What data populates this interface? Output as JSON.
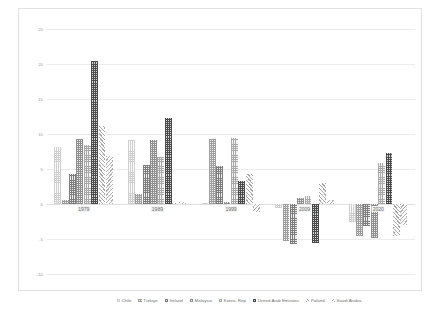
{
  "chart_data": {
    "type": "bar",
    "title": "",
    "subtitle": "",
    "xlabel": "",
    "ylabel": "",
    "categories": [
      "1979",
      "1989",
      "1999",
      "2009",
      "2020"
    ],
    "ylim": [
      -10,
      25
    ],
    "yticks": [
      25,
      20,
      15,
      10,
      5,
      0,
      -5,
      -10
    ],
    "ytick_labels": [
      "25",
      "20",
      "15",
      "10",
      "5",
      "0",
      "-5",
      "-10"
    ],
    "grid": true,
    "legend_position": "bottom",
    "series": [
      {
        "name": "Chile",
        "pattern": "chile",
        "color": "#cfcfcf",
        "values": [
          8.1,
          9.2,
          0.2,
          -0.5,
          -2.6
        ]
      },
      {
        "name": "Türkiye",
        "pattern": "turkiye",
        "color": "#9d9d9d",
        "values": [
          0.6,
          1.4,
          9.3,
          -5.3,
          -4.6
        ]
      },
      {
        "name": "Ireland",
        "pattern": "ireland",
        "color": "#7d7d7d",
        "values": [
          4.3,
          5.6,
          5.5,
          -5.7,
          -3.2
        ]
      },
      {
        "name": "Malaysia",
        "pattern": "malaysia",
        "color": "#8e8e8e",
        "values": [
          9.3,
          9.1,
          0.3,
          0.9,
          -4.8
        ]
      },
      {
        "name": "Korea, Rep",
        "pattern": "korea",
        "color": "#a8a8a8",
        "values": [
          8.4,
          6.7,
          9.5,
          1.2,
          5.8
        ]
      },
      {
        "name": "United Arab Emirates",
        "pattern": "uae",
        "color": "#4a4a4a",
        "values": [
          20.5,
          12.3,
          3.3,
          -5.6,
          7.3
        ]
      },
      {
        "name": "Poland",
        "pattern": "poland",
        "color": "#a6a6a6",
        "values": [
          11.2,
          0.1,
          4.3,
          3.0,
          -4.6
        ]
      },
      {
        "name": "Saudi Arabia",
        "pattern": "saudi",
        "color": "#b0b0b0",
        "values": [
          6.9,
          0.3,
          -1.1,
          0.6,
          -3.0
        ]
      }
    ]
  }
}
